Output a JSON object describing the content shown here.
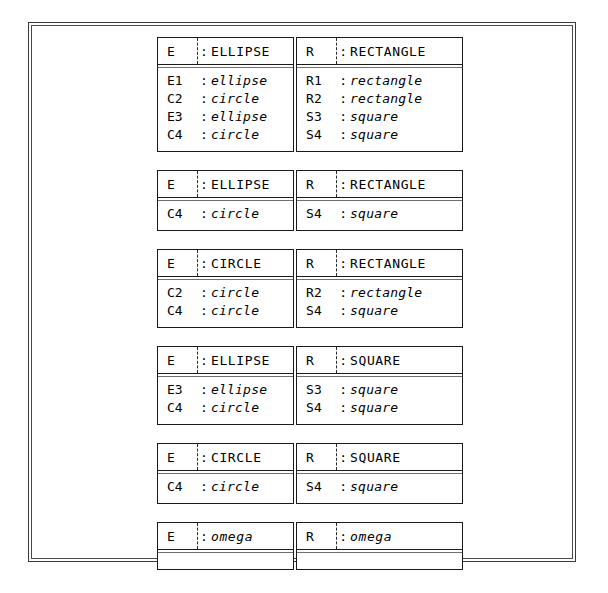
{
  "figure": {
    "frame": "double-line-border",
    "ink_color": "#000000",
    "background": "#ffffff",
    "colon_separator": ":"
  },
  "groups": [
    {
      "id": "group-1",
      "left": {
        "header": {
          "name": "E",
          "relation": "ELLIPSE",
          "italic": false
        },
        "rows": [
          {
            "key": "E1",
            "value": "ellipse"
          },
          {
            "key": "C2",
            "value": "circle"
          },
          {
            "key": "E3",
            "value": "ellipse"
          },
          {
            "key": "C4",
            "value": "circle"
          }
        ]
      },
      "right": {
        "header": {
          "name": "R",
          "relation": "RECTANGLE",
          "italic": false
        },
        "rows": [
          {
            "key": "R1",
            "value": "rectangle"
          },
          {
            "key": "R2",
            "value": "rectangle"
          },
          {
            "key": "S3",
            "value": "square"
          },
          {
            "key": "S4",
            "value": "square"
          }
        ]
      }
    },
    {
      "id": "group-2",
      "left": {
        "header": {
          "name": "E",
          "relation": "ELLIPSE",
          "italic": false
        },
        "rows": [
          {
            "key": "C4",
            "value": "circle"
          }
        ]
      },
      "right": {
        "header": {
          "name": "R",
          "relation": "RECTANGLE",
          "italic": false
        },
        "rows": [
          {
            "key": "S4",
            "value": "square"
          }
        ]
      }
    },
    {
      "id": "group-3",
      "left": {
        "header": {
          "name": "E",
          "relation": "CIRCLE",
          "italic": false
        },
        "rows": [
          {
            "key": "C2",
            "value": "circle"
          },
          {
            "key": "C4",
            "value": "circle"
          }
        ]
      },
      "right": {
        "header": {
          "name": "R",
          "relation": "RECTANGLE",
          "italic": false
        },
        "rows": [
          {
            "key": "R2",
            "value": "rectangle"
          },
          {
            "key": "S4",
            "value": "square"
          }
        ]
      }
    },
    {
      "id": "group-4",
      "left": {
        "header": {
          "name": "E",
          "relation": "ELLIPSE",
          "italic": false
        },
        "rows": [
          {
            "key": "E3",
            "value": "ellipse"
          },
          {
            "key": "C4",
            "value": "circle"
          }
        ]
      },
      "right": {
        "header": {
          "name": "R",
          "relation": "SQUARE",
          "italic": false
        },
        "rows": [
          {
            "key": "S3",
            "value": "square"
          },
          {
            "key": "S4",
            "value": "square"
          }
        ]
      }
    },
    {
      "id": "group-5",
      "left": {
        "header": {
          "name": "E",
          "relation": "CIRCLE",
          "italic": false
        },
        "rows": [
          {
            "key": "C4",
            "value": "circle"
          }
        ]
      },
      "right": {
        "header": {
          "name": "R",
          "relation": "SQUARE",
          "italic": false
        },
        "rows": [
          {
            "key": "S4",
            "value": "square"
          }
        ]
      }
    },
    {
      "id": "group-6",
      "left": {
        "header": {
          "name": "E",
          "relation": "omega",
          "italic": true
        },
        "rows": []
      },
      "right": {
        "header": {
          "name": "R",
          "relation": "omega",
          "italic": true
        },
        "rows": []
      }
    }
  ]
}
